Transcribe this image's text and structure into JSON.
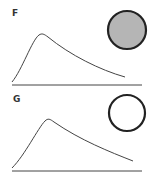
{
  "panels": [
    {
      "label": "F",
      "circle_fill": "#b5b5b5",
      "circle_stroke": "#222222"
    },
    {
      "label": "G",
      "circle_fill": "#ffffff",
      "circle_stroke": "#222222"
    }
  ]
}
